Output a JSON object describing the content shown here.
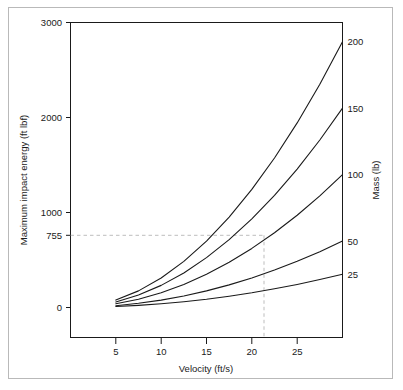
{
  "figure": {
    "background_color": "#ffffff",
    "frame_color": "#b9b9b9",
    "line_color": "#1a1a1a",
    "guide_color": "#bdbdbd"
  },
  "chart_data": {
    "type": "line",
    "title": "",
    "xlabel": "Velocity (ft/s)",
    "ylabel": "Maximum impact energy (ft lbf)",
    "y2label": "Mass (lb)",
    "xlim": [
      0,
      30
    ],
    "ylim": [
      0,
      3000
    ],
    "grid": false,
    "legend_position": "right-axis-end-labels",
    "xticks": [
      5,
      10,
      15,
      20,
      25
    ],
    "xtick_labels": [
      "5",
      "10",
      "15",
      "20",
      "25"
    ],
    "yticks": [
      0,
      755,
      1000,
      2000,
      3000
    ],
    "ytick_labels": [
      "0",
      "755",
      "1000",
      "2000",
      "3000"
    ],
    "y2_labels": [
      "25",
      "50",
      "100",
      "150",
      "200"
    ],
    "x": [
      5,
      7.5,
      10,
      12.5,
      15,
      17.5,
      20,
      22.5,
      25,
      27.5,
      30
    ],
    "series": [
      {
        "name": "200",
        "mass_lb": 200,
        "end_label": "200",
        "values": [
          78,
          175,
          311,
          486,
          699,
          952,
          1243,
          1574,
          1943,
          2351,
          2798
        ]
      },
      {
        "name": "150",
        "mass_lb": 150,
        "end_label": "150",
        "values": [
          58,
          131,
          233,
          364,
          525,
          714,
          933,
          1180,
          1457,
          1763,
          2098
        ]
      },
      {
        "name": "100",
        "mass_lb": 100,
        "end_label": "100",
        "values": [
          39,
          87,
          155,
          243,
          350,
          476,
          622,
          787,
          971,
          1175,
          1399
        ]
      },
      {
        "name": "50",
        "mass_lb": 50,
        "end_label": "50",
        "values": [
          19,
          44,
          78,
          121,
          175,
          238,
          311,
          394,
          486,
          588,
          699
        ]
      },
      {
        "name": "25",
        "mass_lb": 25,
        "end_label": "25",
        "values": [
          10,
          22,
          39,
          61,
          87,
          119,
          155,
          197,
          243,
          294,
          350
        ]
      }
    ],
    "annotations": [
      {
        "name": "energy-guide",
        "type": "dashed-horizontal",
        "y_value": 755,
        "label": "755",
        "from_x": 0,
        "to_x": 21.5
      },
      {
        "name": "velocity-guide",
        "type": "dashed-vertical",
        "x_value": 21.5,
        "from_y": 755,
        "to_y": 0
      }
    ]
  }
}
